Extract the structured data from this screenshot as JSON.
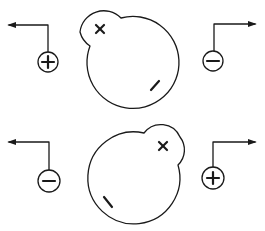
{
  "diagram": {
    "colors": {
      "line": "#1a1a1a",
      "background": "#ffffff"
    },
    "panels": [
      {
        "id": "top",
        "blob": {
          "main_center": [
            133,
            62
          ],
          "main_r": 46,
          "lobe_center": [
            103,
            33
          ],
          "lobe_r": 24
        },
        "inner_marks": [
          {
            "symbol": "x",
            "label": "×",
            "pos": [
              100,
              29
            ]
          },
          {
            "symbol": "minus",
            "label": "/",
            "pos": [
              155,
              85
            ]
          }
        ],
        "left_terminal": {
          "sign": "+",
          "label": "plus-terminal",
          "center": [
            48,
            62
          ],
          "r": 10,
          "arrow_direction": "left"
        },
        "right_terminal": {
          "sign": "−",
          "label": "minus-terminal",
          "center": [
            213,
            61
          ],
          "r": 10,
          "arrow_direction": "right"
        }
      },
      {
        "id": "bottom",
        "blob": {
          "main_center": [
            133,
            178
          ],
          "main_r": 46,
          "lobe_center": [
            163,
            148
          ],
          "lobe_r": 21
        },
        "inner_marks": [
          {
            "symbol": "x",
            "label": "×",
            "pos": [
              163,
              146
            ]
          },
          {
            "symbol": "minus",
            "label": "\\",
            "pos": [
              108,
              202
            ]
          }
        ],
        "left_terminal": {
          "sign": "−",
          "label": "minus-terminal",
          "center": [
            49,
            181
          ],
          "r": 11,
          "arrow_direction": "left"
        },
        "right_terminal": {
          "sign": "+",
          "label": "plus-terminal",
          "center": [
            213,
            178
          ],
          "r": 11,
          "arrow_direction": "right"
        }
      }
    ]
  }
}
